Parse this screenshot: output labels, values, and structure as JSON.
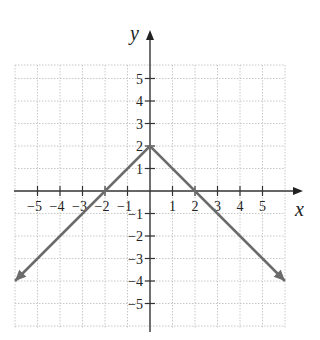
{
  "chart_data": {
    "type": "line",
    "title": "",
    "xlabel": "x",
    "ylabel": "y",
    "xlim": [
      -6,
      6
    ],
    "ylim": [
      -6,
      6
    ],
    "grid": true,
    "x_ticks": [
      -5,
      -4,
      -3,
      -2,
      -1,
      1,
      2,
      3,
      4,
      5
    ],
    "x_tick_labels": [
      "−5",
      "−4",
      "−3",
      "−2",
      "−1",
      "1",
      "2",
      "3",
      "4",
      "5"
    ],
    "y_ticks": [
      5,
      4,
      3,
      2,
      1,
      -1,
      -2,
      -3,
      -4,
      -5
    ],
    "y_tick_labels": [
      "5",
      "4",
      "3",
      "2",
      "1",
      "−1",
      "−2",
      "−3",
      "−4",
      "−5"
    ],
    "series": [
      {
        "name": "y = -|x| + 2",
        "x": [
          -6,
          0,
          6
        ],
        "y": [
          -4,
          2,
          -4
        ],
        "color": "#6b6b6b",
        "arrows_at_ends": true
      }
    ]
  }
}
